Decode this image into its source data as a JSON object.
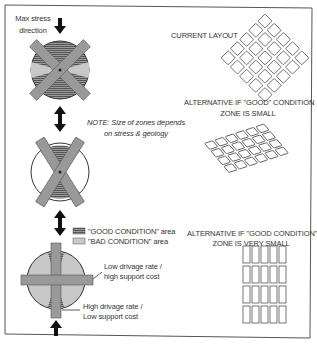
{
  "labels": {
    "max_stress": [
      "Max stress",
      "direction"
    ],
    "current_layout": "CURRENT LAYOUT",
    "alt_small": [
      "ALTERNATIVE IF \"GOOD\" CONDITION",
      "ZONE IS SMALL"
    ],
    "note": [
      "NOTE: Size of zones depends",
      "on stress & geology"
    ],
    "legend_good": "\"GOOD CONDITION\" area",
    "legend_bad": "\"BAD CONDITION\" area",
    "alt_very_small": [
      "ALTERNATIVE IF \"GOOD CONDITION\"",
      "ZONE IS VERY SMALL"
    ],
    "low_drivage": [
      "Low drivage rate /",
      "high support cost"
    ],
    "high_drivage": [
      "High drivage rate /",
      "Low support cost"
    ]
  },
  "colors": {
    "frame": "#555555",
    "good_fill": "#8a8a8a",
    "bad_fill": "#c8c8c8",
    "roadway": "#9a9a9a",
    "arrow": "#111111",
    "pillar_stroke": "#555555"
  },
  "layouts": {
    "current": {
      "grid": "5x5",
      "orientation": "diamond 45deg"
    },
    "alt_small": {
      "grid": "4x6",
      "orientation": "rhombus"
    },
    "alt_very_small": {
      "grid": "5x4",
      "orientation": "orthogonal rectangles"
    }
  }
}
